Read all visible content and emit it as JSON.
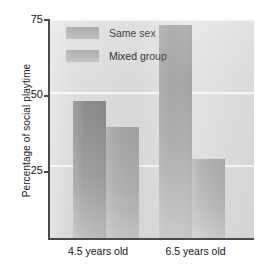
{
  "chart_data": {
    "type": "bar",
    "title": "",
    "subtitle": "",
    "xlabel": "",
    "ylabel": "Percentage of social playtime",
    "categories": [
      "4.5 years old",
      "6.5 years old"
    ],
    "series": [
      {
        "name": "Same sex",
        "values": [
          47,
          73
        ],
        "color": "#9b9b9b"
      },
      {
        "name": "Mixed group",
        "values": [
          38,
          27
        ],
        "color": "#b4b4b4"
      }
    ],
    "ylim": [
      0,
      75
    ],
    "yticks": [
      25,
      50,
      75
    ],
    "ytick_labels": [
      "25",
      "50",
      "75"
    ],
    "grid": true,
    "grid_color": "#fbfbfb",
    "legend_position": "top-left-inside",
    "panel_color": "#dedede",
    "axis_color": "#4a4a4a",
    "text_color": "#141414"
  },
  "axis": {
    "y_title": "Percentage of social playtime",
    "tick_75": "75",
    "tick_50": "50",
    "tick_25": "25"
  },
  "legend": {
    "items": [
      {
        "label": "Same sex"
      },
      {
        "label": "Mixed group"
      }
    ]
  },
  "categories": {
    "left": "4.5 years old",
    "right": "6.5 years old"
  }
}
